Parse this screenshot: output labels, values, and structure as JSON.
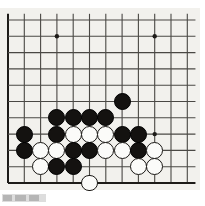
{
  "figure": {
    "board_label": "go-board",
    "board_size_visible": {
      "columns": 12,
      "rows": 11
    },
    "background_color": "#f2f1ed",
    "line_color": "#4a4844",
    "edge_color": "#1d1b18"
  },
  "board": {
    "origin_x": 8,
    "origin_y": 20,
    "spacing": 16.3,
    "columns": 12,
    "rows": 11,
    "edges": {
      "left": true,
      "right": false,
      "top": false,
      "bottom": true
    },
    "star_points": [
      {
        "col": 3,
        "row": 1,
        "x": 57,
        "y": 36
      },
      {
        "col": 9,
        "row": 1,
        "x": 155,
        "y": 36
      },
      {
        "col": 9,
        "row": 7,
        "x": 155,
        "y": 134
      }
    ]
  },
  "chart_data": {
    "type": "scatter",
    "xlabel": "",
    "ylabel": "",
    "grid": true,
    "legend": [
      "black stone",
      "white stone"
    ],
    "stones": [
      {
        "color": "black",
        "col": 7,
        "row": 5
      },
      {
        "color": "black",
        "col": 3,
        "row": 6
      },
      {
        "color": "black",
        "col": 4,
        "row": 6
      },
      {
        "color": "black",
        "col": 5,
        "row": 6
      },
      {
        "color": "black",
        "col": 6,
        "row": 6
      },
      {
        "color": "black",
        "col": 1,
        "row": 7
      },
      {
        "color": "black",
        "col": 3,
        "row": 7
      },
      {
        "color": "white",
        "col": 4,
        "row": 7
      },
      {
        "color": "white",
        "col": 5,
        "row": 7
      },
      {
        "color": "white",
        "col": 6,
        "row": 7
      },
      {
        "color": "black",
        "col": 7,
        "row": 7
      },
      {
        "color": "black",
        "col": 8,
        "row": 7
      },
      {
        "color": "black",
        "col": 1,
        "row": 8
      },
      {
        "color": "white",
        "col": 2,
        "row": 8
      },
      {
        "color": "white",
        "col": 3,
        "row": 8
      },
      {
        "color": "black",
        "col": 4,
        "row": 8
      },
      {
        "color": "black",
        "col": 5,
        "row": 8
      },
      {
        "color": "white",
        "col": 6,
        "row": 8
      },
      {
        "color": "white",
        "col": 7,
        "row": 8
      },
      {
        "color": "black",
        "col": 8,
        "row": 8
      },
      {
        "color": "white",
        "col": 9,
        "row": 8
      },
      {
        "color": "white",
        "col": 2,
        "row": 9
      },
      {
        "color": "black",
        "col": 3,
        "row": 9
      },
      {
        "color": "black",
        "col": 4,
        "row": 9
      },
      {
        "color": "white",
        "col": 8,
        "row": 9
      },
      {
        "color": "white",
        "col": 9,
        "row": 9
      },
      {
        "color": "white",
        "col": 5,
        "row": 10
      }
    ],
    "counts": {
      "black": 15,
      "white": 12,
      "total": 27
    }
  },
  "caption": {
    "present": true,
    "text": ""
  }
}
